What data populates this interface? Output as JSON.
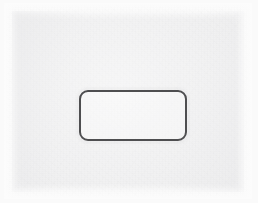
{
  "document": {
    "kind": "scanned-page",
    "title": "Scanned paper page with blank rounded rectangle",
    "canvas": {
      "width": 258,
      "height": 203
    },
    "visible_text": "",
    "text_content_note": "No text, labels, numbers, or icons are present on the page.",
    "colors": {
      "scan_margin": "#fafafa",
      "paper": "#ededee",
      "paper_highlight": "#f6f6f7",
      "ink_stroke": "#4e4e50"
    }
  },
  "paper": {
    "name": "paper-sheet",
    "left": 12,
    "top": 11,
    "width": 232,
    "height": 181,
    "fill": "#ededee",
    "texture": "fibrous grain, uneven illumination, feathered edges"
  },
  "field_box": {
    "name": "blank-rounded-rectangle",
    "shape": "rounded-rectangle",
    "left": 79,
    "top": 90,
    "width": 108,
    "height": 51,
    "corner_radius": 9,
    "stroke_width": 2,
    "stroke_color": "#4e4e50",
    "fill": "none",
    "contents": "",
    "label": ""
  }
}
